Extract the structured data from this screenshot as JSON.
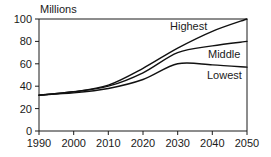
{
  "chart_data": {
    "type": "line",
    "title": "",
    "ylabel": "Millions",
    "xlabel": "",
    "x": [
      1990,
      2000,
      2010,
      2020,
      2030,
      2040,
      2050
    ],
    "xlim": [
      1990,
      2050
    ],
    "ylim": [
      0,
      100
    ],
    "xticks": [
      "1990",
      "2000",
      "2010",
      "2020",
      "2030",
      "2040",
      "2050"
    ],
    "yticks": [
      "0",
      "20",
      "40",
      "60",
      "80",
      "100"
    ],
    "grid": false,
    "legend_position": "inline-right",
    "series": [
      {
        "name": "Highest",
        "label": "Highest",
        "values": [
          32,
          35,
          41,
          56,
          74,
          89,
          100
        ]
      },
      {
        "name": "Middle",
        "label": "Middle",
        "values": [
          32,
          35,
          40,
          52,
          70,
          76,
          80
        ]
      },
      {
        "name": "Lowest",
        "label": "Lowest",
        "values": [
          32,
          34,
          38,
          46,
          60,
          59,
          57
        ]
      }
    ],
    "annotations": [
      {
        "text": "Highest",
        "x": 2032,
        "y": 88
      },
      {
        "text": "Middle",
        "x": 2040,
        "y": 67
      },
      {
        "text": "Lowest",
        "x": 2040,
        "y": 50
      }
    ],
    "colors": {
      "line": "#111111",
      "axis": "#1a1a1a",
      "background": "#ffffff"
    }
  },
  "axis": {
    "y_unit_label": "Millions"
  }
}
